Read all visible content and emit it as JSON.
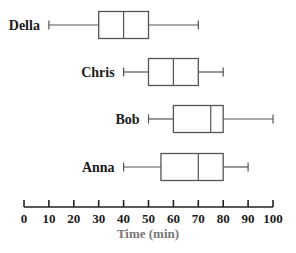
{
  "chart_data": {
    "type": "boxplot",
    "title": "",
    "xlabel": "Time (min)",
    "ylabel": "",
    "xlim": [
      0,
      100
    ],
    "x_ticks": [
      0,
      10,
      20,
      30,
      40,
      50,
      60,
      70,
      80,
      90,
      100
    ],
    "grid": false,
    "legend": null,
    "series": [
      {
        "name": "Della",
        "min": 10,
        "q1": 30,
        "median": 40,
        "q3": 50,
        "max": 70
      },
      {
        "name": "Chris",
        "min": 40,
        "q1": 50,
        "median": 60,
        "q3": 70,
        "max": 80
      },
      {
        "name": "Bob",
        "min": 50,
        "q1": 60,
        "median": 75,
        "q3": 80,
        "max": 100
      },
      {
        "name": "Anna",
        "min": 40,
        "q1": 55,
        "median": 70,
        "q3": 80,
        "max": 90
      }
    ]
  },
  "layout": {
    "x0_px": 24,
    "x100_px": 273,
    "row_centers_px": [
      25,
      72,
      119,
      167
    ],
    "box_half_height": 13.5,
    "cap_half_height": 4.5,
    "axis_y": 207,
    "colors": {
      "lines": "#555555",
      "axis": "#222222",
      "xlabel": "#777777",
      "text": "#1a1a1a"
    }
  }
}
